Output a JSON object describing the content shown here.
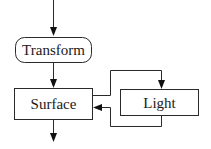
{
  "diagram": {
    "type": "flowchart",
    "nodes": [
      {
        "id": "transform",
        "label": "Transform",
        "shape": "rounded-rect"
      },
      {
        "id": "surface",
        "label": "Surface",
        "shape": "rect"
      },
      {
        "id": "light",
        "label": "Light",
        "shape": "rect"
      }
    ],
    "edges": [
      {
        "from": "input",
        "to": "transform"
      },
      {
        "from": "transform",
        "to": "surface"
      },
      {
        "from": "surface",
        "to": "light"
      },
      {
        "from": "light",
        "to": "surface"
      },
      {
        "from": "surface",
        "to": "output"
      }
    ],
    "colors": {
      "stroke": "#2a2a2a",
      "background": "#ffffff",
      "text": "#1a1a1a"
    }
  }
}
